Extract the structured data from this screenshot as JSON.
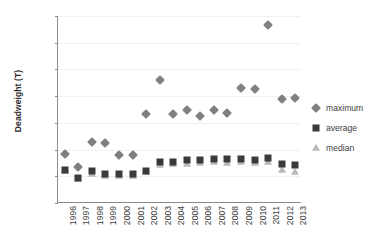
{
  "chart_data": {
    "type": "scatter",
    "title": "",
    "xlabel": "",
    "ylabel": "Deadweight (T)",
    "ylim": [
      0,
      14000
    ],
    "ytick_step": 2000,
    "yticks": [
      0,
      2000,
      4000,
      6000,
      8000,
      10000,
      12000,
      14000
    ],
    "ytick_labels": [
      "0",
      "2000",
      "4000",
      "6000",
      "8000",
      "10000",
      "12000",
      "14000"
    ],
    "grid": true,
    "legend_position": "right",
    "categories": [
      "1996",
      "1997",
      "1998",
      "1999",
      "2000",
      "2001",
      "2002",
      "2003",
      "2004",
      "2005",
      "2006",
      "2007",
      "2008",
      "2009",
      "2010",
      "2011",
      "2012",
      "2013"
    ],
    "series": [
      {
        "name": "maximum",
        "marker": "diamond",
        "color": "#808080",
        "values": [
          3700,
          2700,
          4550,
          4500,
          3600,
          3620,
          6700,
          9200,
          6650,
          7000,
          6550,
          6950,
          6750,
          8580,
          8520,
          13300,
          7800,
          7870
        ]
      },
      {
        "name": "average",
        "marker": "square",
        "color": "#3a3a3a",
        "values": [
          2450,
          1900,
          2400,
          2200,
          2150,
          2150,
          2400,
          3050,
          3100,
          3200,
          3220,
          3300,
          3280,
          3300,
          3250,
          3400,
          2900,
          2880
        ]
      },
      {
        "name": "median",
        "marker": "triangle",
        "color": "#b9b9b9",
        "values": [
          2380,
          1780,
          2150,
          2050,
          2050,
          2020,
          2350,
          2880,
          2920,
          2950,
          3000,
          3050,
          3030,
          3050,
          3000,
          3050,
          2500,
          2350
        ]
      }
    ]
  },
  "legend": {
    "items": [
      {
        "label": "maximum",
        "icon": "diamond-marker-icon"
      },
      {
        "label": "average",
        "icon": "square-marker-icon"
      },
      {
        "label": "median",
        "icon": "triangle-marker-icon"
      }
    ]
  }
}
